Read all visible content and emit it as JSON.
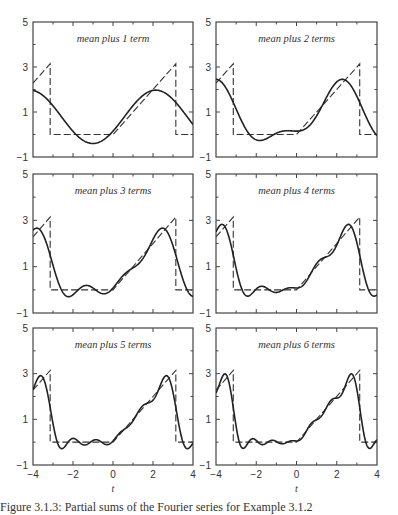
{
  "chart_data": {
    "type": "line",
    "layout": {
      "rows": 3,
      "cols": 2
    },
    "shared": {
      "xlim": [
        -4,
        4
      ],
      "ylim": [
        -1,
        5
      ],
      "xticks": [
        -4,
        -2,
        0,
        2,
        4
      ],
      "xtick_labels": [
        "−4",
        "−2",
        "0",
        "2",
        "4"
      ],
      "yticks": [
        -1,
        1,
        3,
        5
      ],
      "ytick_labels": [
        "−1",
        "1",
        "3",
        "5"
      ],
      "xlabel": "t",
      "grid": false,
      "legend": "none"
    },
    "target_function": {
      "name": "f(t)",
      "style": "dashed",
      "definition": "f(t) = 0 for -pi < t < 0; f(t) = t for 0 < t < pi; period 2*pi",
      "points": [
        [
          -4,
          2.283
        ],
        [
          -3.1416,
          3.1416
        ],
        [
          -3.1416,
          0
        ],
        [
          0,
          0
        ],
        [
          3.1416,
          3.1416
        ],
        [
          3.1416,
          0
        ],
        [
          4,
          0
        ]
      ]
    },
    "fourier_series": {
      "style": "solid",
      "mean": 0.7854,
      "a_n": "(cos(n*pi) - 1) / (pi * n^2)",
      "b_n": "-cos(n*pi) / n"
    },
    "panels": [
      {
        "title": "mean plus 1 term",
        "terms": 1,
        "show_xlabels": false,
        "samples": {
          "t": [
            -4,
            -3.1416,
            -1,
            0,
            2.5,
            4
          ],
          "y": [
            1.98,
            1.42,
            -0.4,
            0.15,
            1.89,
            0.43
          ]
        }
      },
      {
        "title": "mean plus 2 terms",
        "terms": 2,
        "show_xlabels": false,
        "samples": {
          "t": [
            -4,
            -2,
            0,
            2.5,
            4
          ],
          "y": [
            2.45,
            -0.2,
            0.15,
            2.35,
            0.0
          ]
        }
      },
      {
        "title": "mean plus 3 terms",
        "terms": 3,
        "show_xlabels": false,
        "samples": {
          "t": [
            -3.8,
            -2.6,
            -1.6,
            2.7,
            4
          ],
          "y": [
            2.65,
            -0.35,
            0.15,
            2.6,
            -0.35
          ]
        }
      },
      {
        "title": "mean plus 4 terms",
        "terms": 4,
        "show_xlabels": false,
        "samples": {
          "t": [
            -3.7,
            -2.7,
            2.8,
            3.9
          ],
          "y": [
            2.8,
            -0.3,
            2.8,
            -0.3
          ]
        }
      },
      {
        "title": "mean plus 5 terms",
        "terms": 5,
        "show_xlabels": true,
        "samples": {
          "t": [
            -3.6,
            -2.7,
            2.8,
            3.8
          ],
          "y": [
            2.9,
            -0.25,
            2.9,
            -0.25
          ]
        }
      },
      {
        "title": "mean plus 6 terms",
        "terms": 6,
        "show_xlabels": true,
        "samples": {
          "t": [
            -3.6,
            -2.8,
            2.8,
            3.7
          ],
          "y": [
            3.0,
            -0.25,
            3.0,
            -0.3
          ]
        }
      }
    ]
  },
  "caption": "Figure 3.1.3: Partial sums of the Fourier series for Example 3.1.2"
}
